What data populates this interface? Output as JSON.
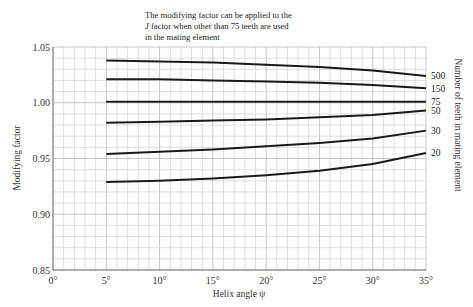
{
  "annotation": {
    "line1": "The modifying factor can be applied to the",
    "line2_italic": "J",
    "line2_rest": " factor when other than 75 teeth are used",
    "line3": "in the mating element"
  },
  "chart_data": {
    "type": "line",
    "title": "",
    "annotation": "The modifying factor can be applied to the J factor when other than 75 teeth are used in the mating element",
    "xlabel": "Helix angle ψ",
    "ylabel": "Modifying factor",
    "right_label": "Number of teeth in mating element",
    "xlim": [
      0,
      35
    ],
    "ylim": [
      0.85,
      1.05
    ],
    "x_ticks": [
      "0°",
      "5°",
      "10°",
      "15°",
      "20°",
      "25°",
      "30°",
      "35°"
    ],
    "y_ticks": [
      "0.85",
      "0.90",
      "0.95",
      "1.00",
      "1.05"
    ],
    "grid": true,
    "legend_position": "right (inline end labels)",
    "x": [
      5,
      10,
      15,
      20,
      25,
      30,
      35
    ],
    "series": [
      {
        "name": "500",
        "values": [
          1.038,
          1.037,
          1.036,
          1.034,
          1.032,
          1.029,
          1.024
        ]
      },
      {
        "name": "150",
        "values": [
          1.021,
          1.021,
          1.02,
          1.019,
          1.018,
          1.016,
          1.013
        ]
      },
      {
        "name": "75",
        "values": [
          1.001,
          1.001,
          1.001,
          1.001,
          1.001,
          1.001,
          1.001
        ]
      },
      {
        "name": "50",
        "values": [
          0.982,
          0.983,
          0.984,
          0.985,
          0.987,
          0.989,
          0.993
        ]
      },
      {
        "name": "30",
        "values": [
          0.954,
          0.956,
          0.958,
          0.961,
          0.964,
          0.968,
          0.975
        ]
      },
      {
        "name": "20",
        "values": [
          0.929,
          0.93,
          0.932,
          0.935,
          0.939,
          0.945,
          0.955
        ]
      }
    ]
  }
}
